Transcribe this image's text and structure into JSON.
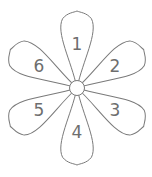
{
  "diagram": {
    "type": "flower",
    "center": {
      "x": 77,
      "y": 88,
      "r": 7.5
    },
    "petal_length": 77,
    "petal_half_width": 16,
    "stroke_color": "#7a7a7a",
    "label_color": "#6e6e6e",
    "petals": [
      {
        "label": "1",
        "angle": -90
      },
      {
        "label": "2",
        "angle": -30
      },
      {
        "label": "3",
        "angle": 30
      },
      {
        "label": "4",
        "angle": 90
      },
      {
        "label": "5",
        "angle": 150
      },
      {
        "label": "6",
        "angle": 210
      }
    ]
  }
}
